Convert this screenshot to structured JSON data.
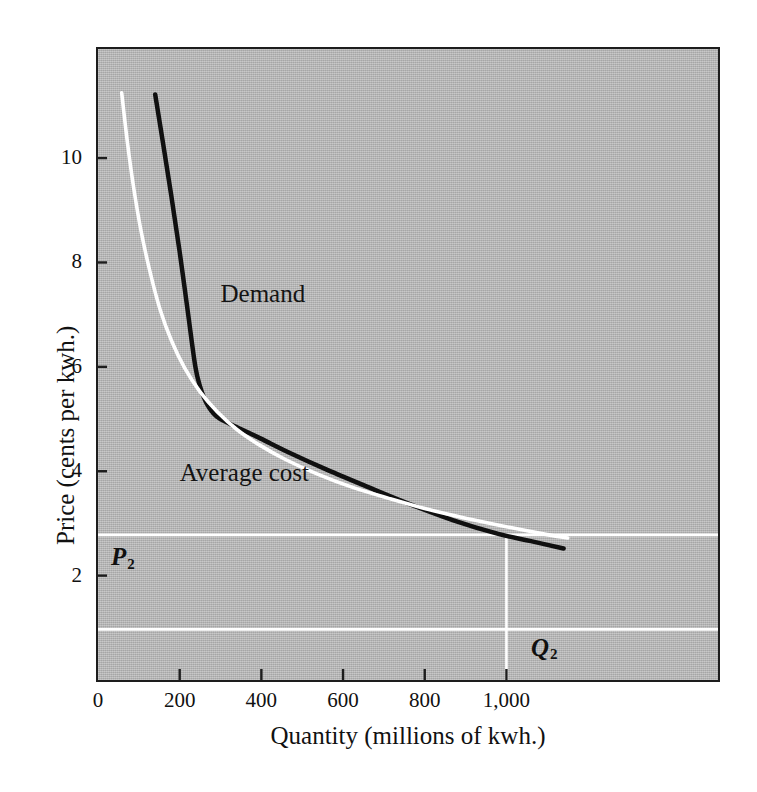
{
  "figure": {
    "background_color": "#ffffff",
    "plot_fill_color": "#b6b6b6",
    "frame_color": "#1d1d1d"
  },
  "chart_data": {
    "type": "line",
    "title": "",
    "xlabel": "Quantity (millions of kwh.)",
    "ylabel": "Price (cents per kwh.)",
    "xlim": [
      0,
      1518
    ],
    "ylim": [
      0,
      12.09
    ],
    "grid": false,
    "legend_position": "inline-labels",
    "xticks": [
      0,
      200,
      400,
      600,
      800,
      1000
    ],
    "xticklabels": [
      "0",
      "200",
      "400",
      "600",
      "800",
      "1,000"
    ],
    "yticks": [
      2,
      4,
      6,
      8,
      10
    ],
    "yticklabels": [
      "2",
      "4",
      "6",
      "8",
      "10"
    ],
    "series": [
      {
        "name": "Demand",
        "color": "#101010",
        "width": 4.5,
        "label_text": "Demand",
        "label_x": 300,
        "label_y": 7.4,
        "points": [
          [
            140,
            11.22
          ],
          [
            160,
            10.25
          ],
          [
            180,
            9.25
          ],
          [
            200,
            8.2
          ],
          [
            220,
            7.05
          ],
          [
            238,
            6.02
          ],
          [
            250,
            5.62
          ],
          [
            266,
            5.3
          ],
          [
            290,
            5.05
          ],
          [
            320,
            4.92
          ],
          [
            352,
            4.8
          ],
          [
            400,
            4.62
          ],
          [
            470,
            4.35
          ],
          [
            560,
            4.03
          ],
          [
            660,
            3.7
          ],
          [
            760,
            3.38
          ],
          [
            870,
            3.06
          ],
          [
            980,
            2.8
          ],
          [
            1060,
            2.66
          ],
          [
            1140,
            2.52
          ]
        ]
      },
      {
        "name": "Average cost",
        "color": "#ffffff",
        "width": 3.6,
        "label_text": "Average cost",
        "label_x": 200,
        "label_y": 3.96,
        "points": [
          [
            58,
            11.25
          ],
          [
            72,
            10.3
          ],
          [
            88,
            9.4
          ],
          [
            106,
            8.58
          ],
          [
            128,
            7.8
          ],
          [
            152,
            7.1
          ],
          [
            180,
            6.5
          ],
          [
            212,
            5.98
          ],
          [
            250,
            5.52
          ],
          [
            292,
            5.14
          ],
          [
            340,
            4.8
          ],
          [
            396,
            4.5
          ],
          [
            460,
            4.22
          ],
          [
            536,
            3.95
          ],
          [
            620,
            3.7
          ],
          [
            712,
            3.48
          ],
          [
            812,
            3.26
          ],
          [
            912,
            3.08
          ],
          [
            1010,
            2.92
          ],
          [
            1090,
            2.8
          ],
          [
            1150,
            2.72
          ]
        ]
      }
    ],
    "reference_lines": [
      {
        "name": "P2",
        "orientation": "horizontal",
        "value": 2.78,
        "color": "#ffffff",
        "label": "P",
        "label_sub": "2",
        "label_x": 32,
        "label_y": 2.33
      },
      {
        "name": "Q2",
        "orientation": "vertical",
        "value": 1000,
        "color": "#ffffff",
        "y_from": 0,
        "y_to": 2.78,
        "label": "Q",
        "label_sub": "2",
        "label_x": 1060,
        "label_y": 0.6
      },
      {
        "name": "lower-guide",
        "orientation": "horizontal",
        "value": 0.97,
        "color": "#ffffff",
        "label": "",
        "label_sub": ""
      }
    ]
  }
}
